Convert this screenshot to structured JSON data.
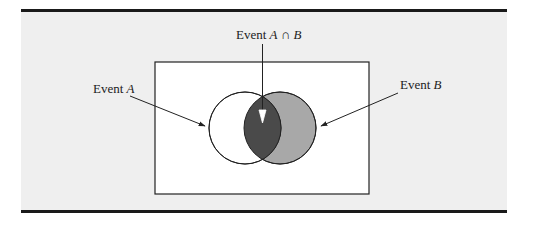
{
  "figure": {
    "type": "venn-diagram",
    "labels": {
      "event_a": {
        "prefix": "Event ",
        "var": "A"
      },
      "event_b": {
        "prefix": "Event ",
        "var": "B"
      },
      "intersection": {
        "prefix": "Event ",
        "var1": "A",
        "op": " ∩ ",
        "var2": "B"
      }
    },
    "colors": {
      "panel_background": "#efefef",
      "sample_space_fill": "#ffffff",
      "event_a_fill": "#ffffff",
      "event_b_fill": "#a8a8a8",
      "intersection_fill": "#4a4a4a",
      "stroke": "#222222"
    }
  }
}
